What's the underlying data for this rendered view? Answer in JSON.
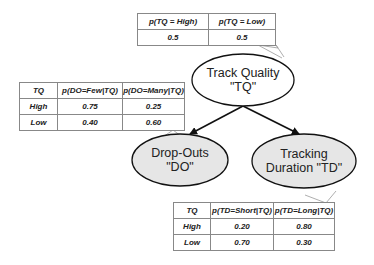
{
  "nodes": {
    "tq": {
      "line1": "Track Quality",
      "line2": "\"TQ\""
    },
    "do": {
      "line1": "Drop-Outs",
      "line2": "\"DO\""
    },
    "td": {
      "line1": "Tracking",
      "line2": "Duration \"TD\""
    }
  },
  "tables": {
    "prior_tq": {
      "headers": [
        "p(TQ = High)",
        "p(TQ = Low)"
      ],
      "rows": [
        [
          "0.5",
          "0.5"
        ]
      ]
    },
    "cpt_do": {
      "headers": [
        "TQ",
        "p(DO=Few|TQ)",
        "p(DO=Many|TQ)"
      ],
      "rows": [
        [
          "High",
          "0.75",
          "0.25"
        ],
        [
          "Low",
          "0.40",
          "0.60"
        ]
      ]
    },
    "cpt_td": {
      "headers": [
        "TQ",
        "p(TD=Short|TQ)",
        "p(TD=Long|TQ)"
      ],
      "rows": [
        [
          "High",
          "0.20",
          "0.80"
        ],
        [
          "Low",
          "0.70",
          "0.30"
        ]
      ]
    }
  },
  "edges": [
    {
      "from": "TQ",
      "to": "DO"
    },
    {
      "from": "TQ",
      "to": "TD"
    }
  ],
  "colors": {
    "root_fill": "#ffffff",
    "child_fill": "#e6e6e6",
    "stroke": "#111111",
    "callout": "#999999"
  }
}
